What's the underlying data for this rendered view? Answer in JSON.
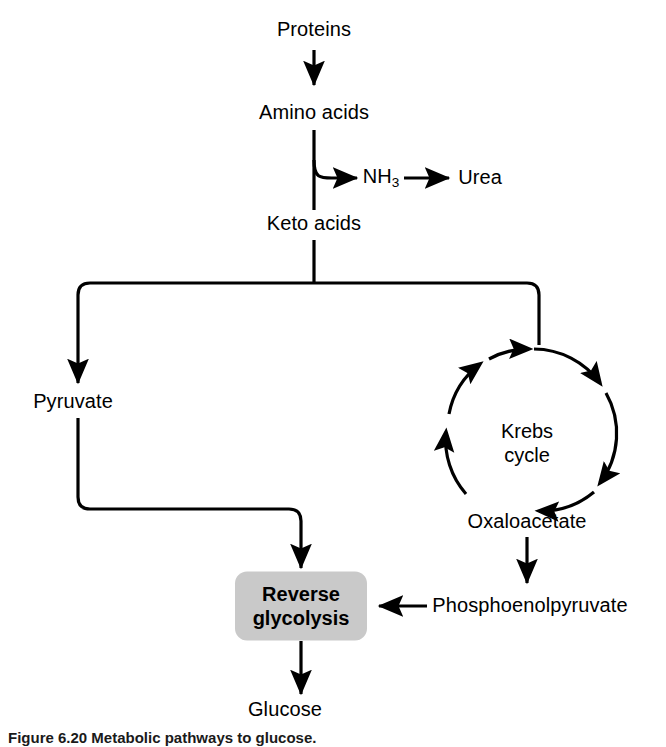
{
  "figure": {
    "domain": "biochemistry-flowchart",
    "caption": "Figure 6.20 Metabolic pathways to glucose.",
    "background_color": "#ffffff",
    "line_color": "#000000",
    "box_fill_color": "#c9c9c9"
  },
  "nodes": {
    "proteins": {
      "label": "Proteins"
    },
    "amino_acids": {
      "label": "Amino acids"
    },
    "ammonia": {
      "label_main": "NH",
      "label_sub": "3"
    },
    "urea": {
      "label": "Urea"
    },
    "keto_acids": {
      "label": "Keto acids"
    },
    "pyruvate": {
      "label": "Pyruvate"
    },
    "krebs_cycle": {
      "label": "Krebs\ncycle"
    },
    "oxaloacetate": {
      "label": "Oxaloacetate"
    },
    "phosphoenolpyruvate": {
      "label": "Phosphoenolpyruvate"
    },
    "reverse_glycolysis": {
      "label": "Reverse\nglycolysis"
    },
    "glucose": {
      "label": "Glucose"
    }
  },
  "pathway_steps": [
    "Proteins → Amino acids",
    "Amino acids → NH3 → Urea",
    "Amino acids → Keto acids",
    "Keto acids → Pyruvate",
    "Keto acids → Krebs cycle",
    "Krebs cycle → Oxaloacetate",
    "Oxaloacetate → Phosphoenolpyruvate",
    "Phosphoenolpyruvate → Reverse glycolysis",
    "Pyruvate → Reverse glycolysis",
    "Reverse glycolysis → Glucose"
  ]
}
